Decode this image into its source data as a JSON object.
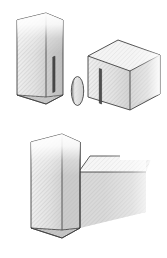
{
  "figure": {
    "title": "Biscuit / spline joint exploded and assembled views",
    "canvas": {
      "width": 167,
      "height": 258,
      "background": "#ffffff"
    },
    "palette": {
      "background": "#ffffff",
      "outline": "#3a3a3a",
      "outline_soft": "#6b6b6b",
      "face_light": "#f2f2f2",
      "face_mid": "#d8d8d8",
      "face_dark": "#c0c0c0",
      "face_shadow": "#a8a8a8",
      "slot_dark": "#4a4a4a",
      "slot_mid": "#777777",
      "hatch": "#bdbdbd"
    },
    "views": [
      {
        "id": "exploded-view",
        "label": "Exploded view",
        "parts": [
          {
            "id": "left-board",
            "label": "Left board with slot",
            "slot": "vertical-slot"
          },
          {
            "id": "biscuit",
            "label": "Biscuit spline",
            "shape": "lens-ellipse"
          },
          {
            "id": "right-block",
            "label": "Right block with slot",
            "slot": "vertical-slot"
          }
        ]
      },
      {
        "id": "assembled-view",
        "label": "Assembled joint",
        "parts": [
          {
            "id": "assembled-vertical-board",
            "label": "Vertical board"
          },
          {
            "id": "assembled-horizontal-board",
            "label": "Mating board"
          },
          {
            "id": "assembled-seam",
            "label": "Joint seam line"
          }
        ]
      }
    ]
  }
}
